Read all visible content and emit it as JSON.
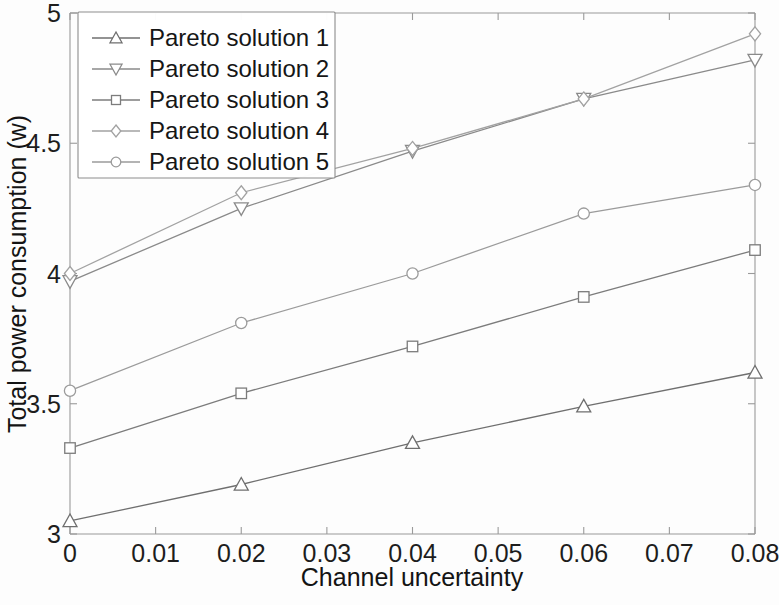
{
  "figure": {
    "background": "#fdfdfd",
    "axis_color": "#9a9a9a",
    "text_color": "#1d1d1d"
  },
  "chart_data": {
    "type": "line",
    "title": "",
    "xlabel": "Channel uncertainty",
    "ylabel": "Total power consumption (w)",
    "x": [
      0,
      0.02,
      0.04,
      0.06,
      0.08
    ],
    "xlim": [
      0,
      0.08
    ],
    "ylim": [
      3,
      5
    ],
    "xticks": [
      0,
      0.01,
      0.02,
      0.03,
      0.04,
      0.05,
      0.06,
      0.07,
      0.08
    ],
    "xtick_labels": [
      "0",
      "0.01",
      "0.02",
      "0.03",
      "0.04",
      "0.05",
      "0.06",
      "0.07",
      "0.08"
    ],
    "yticks": [
      3,
      3.5,
      4,
      4.5,
      5
    ],
    "ytick_labels": [
      "3",
      "3.5",
      "4",
      "4.5",
      "5"
    ],
    "grid": false,
    "legend_position": "upper-left",
    "series": [
      {
        "name": "Pareto solution 1",
        "marker": "triangle-up",
        "color": "#6f6f6f",
        "values": [
          3.05,
          3.19,
          3.35,
          3.49,
          3.62
        ]
      },
      {
        "name": "Pareto solution 2",
        "marker": "triangle-down",
        "color": "#8a8a8a",
        "values": [
          3.97,
          4.25,
          4.47,
          4.67,
          4.82
        ]
      },
      {
        "name": "Pareto solution 3",
        "marker": "square",
        "color": "#7c7c7c",
        "values": [
          3.33,
          3.54,
          3.72,
          3.91,
          4.09
        ]
      },
      {
        "name": "Pareto solution 4",
        "marker": "diamond",
        "color": "#a2a2a2",
        "values": [
          4.0,
          4.31,
          4.48,
          4.67,
          4.92
        ]
      },
      {
        "name": "Pareto solution 5",
        "marker": "circle",
        "color": "#9b9b9b",
        "values": [
          3.55,
          3.81,
          4.0,
          4.23,
          4.34
        ]
      }
    ]
  },
  "legend": {
    "entries": [
      "Pareto solution 1",
      "Pareto solution 2",
      "Pareto solution 3",
      "Pareto solution 4",
      "Pareto solution 5"
    ]
  }
}
